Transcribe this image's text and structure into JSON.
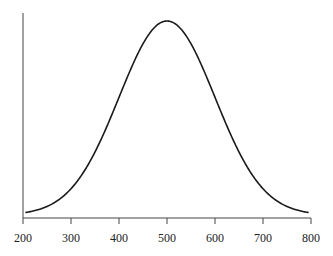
{
  "chart_data": {
    "type": "line",
    "title": "",
    "xlabel": "",
    "ylabel": "",
    "x_ticks": [
      200,
      300,
      400,
      500,
      600,
      700,
      800
    ],
    "xlim": [
      200,
      800
    ],
    "y_ticks": [],
    "grid": false,
    "legend": null,
    "series": [
      {
        "name": "density",
        "distribution": "normal",
        "mean": 500,
        "sd": 100,
        "x": [
          205,
          250,
          300,
          350,
          400,
          450,
          500,
          550,
          600,
          650,
          700,
          750,
          795
        ],
        "y_relative": [
          0.013,
          0.044,
          0.135,
          0.325,
          0.607,
          0.882,
          1.0,
          0.882,
          0.607,
          0.325,
          0.135,
          0.044,
          0.013
        ]
      }
    ],
    "color": "#1a1a1a"
  }
}
